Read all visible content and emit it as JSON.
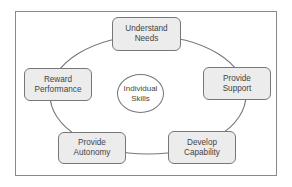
{
  "diagram": {
    "type": "cycle",
    "center": {
      "line1": "Individual",
      "line2": "Skills"
    },
    "nodes": [
      {
        "id": "understand-needs",
        "line1": "Understand",
        "line2": "Needs"
      },
      {
        "id": "provide-support",
        "line1": "Provide",
        "line2": "Support"
      },
      {
        "id": "develop-capability",
        "line1": "Develop",
        "line2": "Capability"
      },
      {
        "id": "provide-autonomy",
        "line1": "Provide",
        "line2": "Autonomy"
      },
      {
        "id": "reward-performance",
        "line1": "Reward",
        "line2": "Performance"
      }
    ],
    "colors": {
      "node_fill": "#ececec",
      "stroke": "#777777",
      "text": "#444444"
    }
  }
}
